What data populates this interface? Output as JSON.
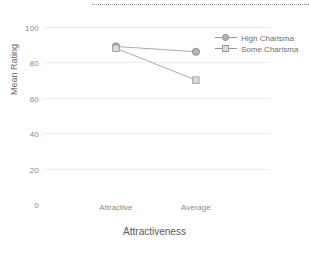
{
  "chart_data": {
    "type": "line",
    "title": "",
    "xlabel": "Attractiveness",
    "ylabel": "Mean Rating",
    "categories": [
      "Attractive",
      "Average"
    ],
    "yticks": [
      0,
      20,
      40,
      60,
      80,
      100
    ],
    "ylim": [
      0,
      100
    ],
    "grid": true,
    "legend_position": "right",
    "series": [
      {
        "name": "High Charisma",
        "marker": "circle",
        "color": "#b4b4b4",
        "values": [
          89,
          86
        ]
      },
      {
        "name": "Some Charisma",
        "marker": "square",
        "color": "#dcdcdc",
        "values": [
          88,
          70
        ]
      }
    ]
  },
  "axes": {
    "y_title": "Mean Rating",
    "x_title": "Attractiveness",
    "y_tick_labels": [
      "100",
      "80",
      "60",
      "40",
      "20",
      "0"
    ],
    "x_tick_labels": [
      "Attractive",
      "Average"
    ]
  },
  "legend": {
    "items": [
      {
        "label": "High Charisma",
        "marker": "circle"
      },
      {
        "label": "Some Charisma",
        "marker": "square"
      }
    ]
  },
  "decor": {
    "top_rule": "dotted-divider"
  }
}
